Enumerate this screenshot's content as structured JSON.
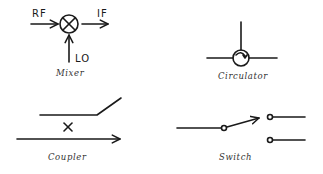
{
  "diagram": {
    "stroke_color": "#1a1a1a",
    "background": "#ffffff",
    "symbols": [
      {
        "id": "mixer",
        "caption": "Mixer",
        "ports": {
          "input": "RF",
          "output": "IF",
          "local_oscillator": "LO"
        },
        "glyph": "circle-with-x"
      },
      {
        "id": "circulator",
        "caption": "Circulator",
        "glyph": "circle-with-clockwise-arrow"
      },
      {
        "id": "coupler",
        "caption": "Coupler",
        "glyph": "x-between-lines"
      },
      {
        "id": "switch",
        "caption": "Switch",
        "glyph": "spdt-switch"
      }
    ]
  }
}
